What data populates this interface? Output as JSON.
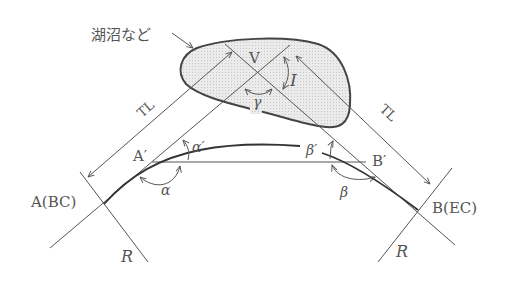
{
  "diagram": {
    "obstacle_label": "湖沼など",
    "points": {
      "V": "V",
      "A": "A(BC)",
      "B": "B(EC)",
      "A_prime": "A′",
      "B_prime": "B′"
    },
    "angles": {
      "I": "I",
      "gamma": "γ",
      "alpha": "α",
      "alpha_prime": "α′",
      "beta": "β",
      "beta_prime": "β′"
    },
    "lengths": {
      "tl_left": "TL",
      "tl_right": "TL"
    },
    "radii": {
      "r_left": "R",
      "r_right": "R"
    },
    "colors": {
      "line": "#555555",
      "curve": "#333333",
      "obstacle_fill": "#e4e4e4",
      "obstacle_stroke": "#444444"
    }
  }
}
